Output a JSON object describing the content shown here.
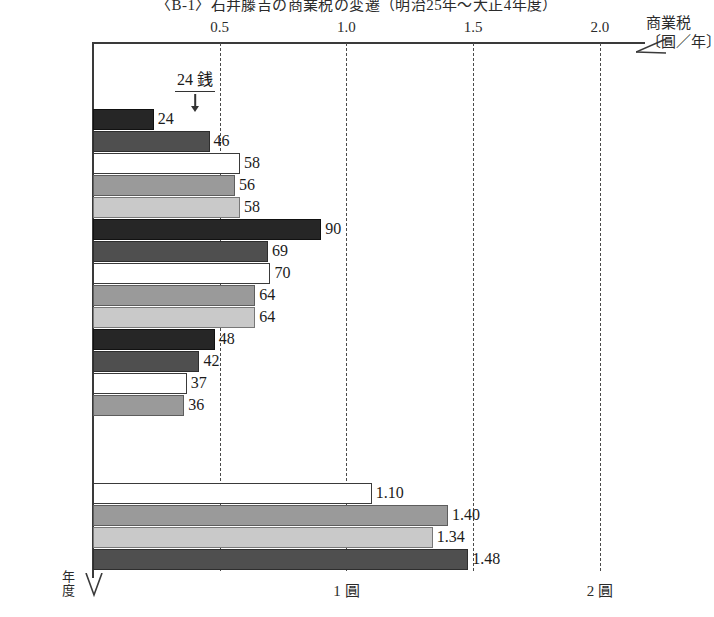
{
  "title": "〈B-1〉石井藤吉の商業税の変遷（明治25年～大正4年度）",
  "axis": {
    "x_caption": "商業税",
    "x_unit": "〔圓／年〕",
    "y_caption_line1": "年",
    "y_caption_line2": "度",
    "top_ticks": [
      "0.5",
      "1.0",
      "1.5",
      "2.0"
    ],
    "foot_labels": [
      {
        "text": "1 圓",
        "value": 1.0
      },
      {
        "text": "2 圓",
        "value": 2.0
      }
    ]
  },
  "annotation": {
    "text": "24 銭",
    "points_to": "M28"
  },
  "chart_data": {
    "type": "bar",
    "orientation": "horizontal",
    "title": "〈B-1〉石井藤吉の商業税の変遷（明治25年～大正4年度）",
    "xlabel": "商業税〔圓／年〕",
    "ylabel": "年度",
    "xlim": [
      0,
      2.15
    ],
    "grid": true,
    "gridlines": [
      0.5,
      1.0,
      1.5,
      2.0
    ],
    "legend": "none",
    "note": "Values for M28–M41 are printed in 銭 (sen, 1/100 圓); values for T1–T4 are printed in 圓 (yen).",
    "categories": [
      "M25",
      "M26",
      "M27",
      "M28",
      "M29",
      "M30",
      "M31",
      "M32",
      "M33",
      "M34",
      "M35",
      "M36",
      "M37",
      "M38",
      "M39",
      "M40",
      "M41",
      "M42",
      "M43",
      "M44",
      "M45、T1",
      "T2",
      "T3",
      "T4"
    ],
    "values": [
      null,
      null,
      null,
      0.24,
      0.46,
      0.58,
      0.56,
      0.58,
      0.9,
      0.69,
      0.7,
      0.64,
      0.64,
      0.48,
      0.42,
      0.37,
      0.36,
      null,
      null,
      null,
      1.1,
      1.4,
      1.34,
      1.48
    ],
    "labels": [
      "",
      "",
      "",
      "24",
      "46",
      "58",
      "56",
      "58",
      "90",
      "69",
      "70",
      "64",
      "64",
      "48",
      "42",
      "37",
      "36",
      "",
      "",
      "",
      "1.10",
      "1.40",
      "1.34",
      "1.48"
    ],
    "rows": [
      {
        "label": "M25",
        "value": null,
        "text": "",
        "fill": ""
      },
      {
        "label": "M26",
        "value": null,
        "text": "",
        "fill": ""
      },
      {
        "label": "M27",
        "value": null,
        "text": "",
        "fill": ""
      },
      {
        "label": "M28",
        "value": 0.24,
        "text": "24",
        "fill": "p-black"
      },
      {
        "label": "M29",
        "value": 0.46,
        "text": "46",
        "fill": "p-dark"
      },
      {
        "label": "M30",
        "value": 0.58,
        "text": "58",
        "fill": "p-white"
      },
      {
        "label": "M31",
        "value": 0.56,
        "text": "56",
        "fill": "p-mid"
      },
      {
        "label": "M32",
        "value": 0.58,
        "text": "58",
        "fill": "p-light"
      },
      {
        "label": "M33",
        "value": 0.9,
        "text": "90",
        "fill": "p-black"
      },
      {
        "label": "M34",
        "value": 0.69,
        "text": "69",
        "fill": "p-dark"
      },
      {
        "label": "M35",
        "value": 0.7,
        "text": "70",
        "fill": "p-white"
      },
      {
        "label": "M36",
        "value": 0.64,
        "text": "64",
        "fill": "p-mid"
      },
      {
        "label": "M37",
        "value": 0.64,
        "text": "64",
        "fill": "p-light"
      },
      {
        "label": "M38",
        "value": 0.48,
        "text": "48",
        "fill": "p-black"
      },
      {
        "label": "M39",
        "value": 0.42,
        "text": "42",
        "fill": "p-dark"
      },
      {
        "label": "M40",
        "value": 0.37,
        "text": "37",
        "fill": "p-white"
      },
      {
        "label": "M41",
        "value": 0.36,
        "text": "36",
        "fill": "p-mid"
      },
      {
        "label": "M42",
        "value": null,
        "text": "",
        "fill": ""
      },
      {
        "label": "M43",
        "value": null,
        "text": "",
        "fill": ""
      },
      {
        "label": "M44",
        "value": null,
        "text": "",
        "fill": ""
      },
      {
        "label": "M45、T1",
        "value": 1.1,
        "text": "1.10",
        "fill": "p-white"
      },
      {
        "label": "T2",
        "value": 1.4,
        "text": "1.40",
        "fill": "p-mid"
      },
      {
        "label": "T3",
        "value": 1.34,
        "text": "1.34",
        "fill": "p-light"
      },
      {
        "label": "T4",
        "value": 1.48,
        "text": "1.48",
        "fill": "p-dark"
      }
    ]
  }
}
